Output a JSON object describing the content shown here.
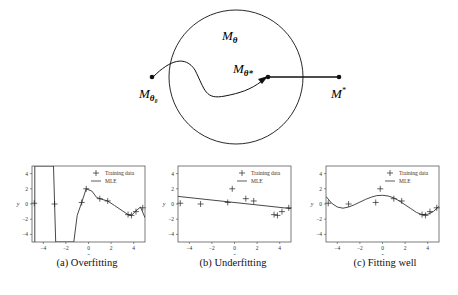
{
  "diagram": {
    "labels": {
      "model_space": "M",
      "model_space_sub": "θ",
      "best_in_class": "M",
      "best_in_class_sub": "θ*",
      "init": "M",
      "init_sub": "θ₀",
      "truth": "M",
      "truth_sup": "*"
    }
  },
  "chart_data": [
    {
      "type": "line",
      "title": "",
      "caption": "(a) Overfitting",
      "xlabel": "x",
      "ylabel": "y",
      "xlim": [
        -5,
        5
      ],
      "ylim": [
        -5,
        5
      ],
      "xticks": [
        -4,
        -2,
        0,
        2,
        4
      ],
      "yticks": [
        -4,
        -2,
        0,
        2,
        4
      ],
      "legend": [
        "Training data",
        "MLE"
      ],
      "legend_position": "top-right",
      "training_data": {
        "x": [
          -4.8,
          -3.0,
          -0.6,
          -0.2,
          1.0,
          1.7,
          3.5,
          3.8,
          4.2,
          4.8
        ],
        "y": [
          0.1,
          0.0,
          0.2,
          2.0,
          0.7,
          0.4,
          -1.4,
          -1.5,
          -1.0,
          -0.5
        ]
      },
      "mle": {
        "x": [
          -4.75,
          -4.75,
          -4.7,
          -3.1,
          -3.0,
          -2.9,
          -1.3,
          -1.0,
          -0.6,
          -0.2,
          0.3,
          0.7,
          1.0,
          1.7,
          2.3,
          3.0,
          3.5,
          3.8,
          4.2,
          4.6,
          5.0
        ],
        "y": [
          -5,
          5,
          5,
          5,
          0,
          -5,
          -5,
          -1.5,
          0.2,
          2.0,
          1.7,
          0.9,
          0.7,
          0.4,
          -0.2,
          -0.9,
          -1.4,
          -1.5,
          -0.9,
          -0.4,
          -1.8
        ]
      }
    },
    {
      "type": "line",
      "title": "",
      "caption": "(b) Underfitting",
      "xlabel": "x",
      "ylabel": "y",
      "xlim": [
        -5,
        5
      ],
      "ylim": [
        -5,
        5
      ],
      "xticks": [
        -4,
        -2,
        0,
        2,
        4
      ],
      "yticks": [
        -4,
        -2,
        0,
        2,
        4
      ],
      "legend": [
        "Training data",
        "MLE"
      ],
      "legend_position": "top-right",
      "training_data": {
        "x": [
          -4.8,
          -3.0,
          -0.6,
          -0.2,
          1.0,
          1.7,
          3.5,
          3.8,
          4.2,
          4.8
        ],
        "y": [
          0.1,
          0.0,
          0.2,
          2.0,
          0.7,
          0.4,
          -1.4,
          -1.5,
          -1.0,
          -0.5
        ]
      },
      "mle": {
        "x": [
          -5,
          5
        ],
        "y": [
          1.0,
          -0.6
        ]
      }
    },
    {
      "type": "line",
      "title": "",
      "caption": "(c) Fitting well",
      "xlabel": "x",
      "ylabel": "y",
      "xlim": [
        -5,
        5
      ],
      "ylim": [
        -5,
        5
      ],
      "xticks": [
        -4,
        -2,
        0,
        2,
        4
      ],
      "yticks": [
        -4,
        -2,
        0,
        2,
        4
      ],
      "legend": [
        "Training data",
        "MLE"
      ],
      "legend_position": "top-right",
      "training_data": {
        "x": [
          -4.8,
          -3.0,
          -0.6,
          -0.2,
          1.0,
          1.7,
          3.5,
          3.8,
          4.2,
          4.8
        ],
        "y": [
          0.1,
          0.0,
          0.2,
          2.0,
          0.7,
          0.4,
          -1.4,
          -1.5,
          -1.0,
          -0.5
        ]
      },
      "mle": {
        "x": [
          -5,
          -4.5,
          -4,
          -3.5,
          -3,
          -2.5,
          -2,
          -1.5,
          -1,
          -0.5,
          0,
          0.5,
          1,
          1.5,
          2,
          2.5,
          3,
          3.5,
          4,
          4.5,
          5
        ],
        "y": [
          1.0,
          0.1,
          -0.4,
          -0.55,
          -0.4,
          -0.1,
          0.25,
          0.6,
          0.9,
          1.1,
          1.15,
          1.05,
          0.8,
          0.4,
          -0.1,
          -0.6,
          -1.1,
          -1.4,
          -1.35,
          -1.0,
          -0.3
        ]
      }
    }
  ]
}
